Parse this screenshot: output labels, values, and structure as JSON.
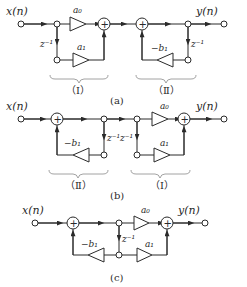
{
  "figure": {
    "panels": [
      {
        "id": "a",
        "caption": "(a)",
        "input_label": "x(n)",
        "output_label": "y(n)",
        "delay_labels": [
          "z⁻¹",
          "z⁻¹"
        ],
        "coefficients": [
          "a₀",
          "a₁",
          "−b₁"
        ],
        "adder_symbol": "+",
        "sections": [
          {
            "label": "（Ⅰ）",
            "description": "feedforward section"
          },
          {
            "label": "（Ⅱ）",
            "description": "feedback section"
          }
        ]
      },
      {
        "id": "b",
        "caption": "(b)",
        "input_label": "x(n)",
        "output_label": "y(n)",
        "delay_labels": [
          "z⁻¹",
          "z⁻¹"
        ],
        "coefficients": [
          "−b₁",
          "a₀",
          "a₁"
        ],
        "adder_symbol": "+",
        "sections": [
          {
            "label": "（Ⅱ）",
            "description": "feedback section"
          },
          {
            "label": "（Ⅰ）",
            "description": "feedforward section"
          }
        ]
      },
      {
        "id": "c",
        "caption": "(c)",
        "input_label": "x(n)",
        "output_label": "y(n)",
        "delay_labels": [
          "z⁻¹"
        ],
        "coefficients": [
          "−b₁",
          "a₀",
          "a₁"
        ],
        "adder_symbol": "+"
      }
    ]
  }
}
